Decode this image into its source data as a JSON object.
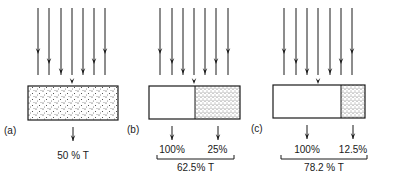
{
  "panels": [
    {
      "id": "a",
      "label": "(a)",
      "box": {
        "x": 28,
        "y": 86,
        "w": 90,
        "h": 34,
        "clear_fraction": 0.0
      },
      "incident_arrows_x": [
        38,
        49,
        61,
        72,
        83,
        94,
        105
      ],
      "outputs": [
        {
          "x": 73,
          "value": "50 % T"
        }
      ],
      "result": ""
    },
    {
      "id": "b",
      "label": "(b)",
      "box": {
        "x": 149,
        "y": 86,
        "w": 91,
        "h": 33,
        "clear_fraction": 0.5
      },
      "incident_arrows_x": [
        160,
        172,
        183,
        194,
        205,
        216,
        228
      ],
      "outputs": [
        {
          "x": 173,
          "value": "100%"
        },
        {
          "x": 213,
          "value": "25%"
        }
      ],
      "result": "62.5% T"
    },
    {
      "id": "c",
      "label": "(c)",
      "box": {
        "x": 273,
        "y": 85,
        "w": 92,
        "h": 33,
        "clear_fraction": 0.74
      },
      "incident_arrows_x": [
        284,
        296,
        307,
        318,
        330,
        341,
        352
      ],
      "outputs": [
        {
          "x": 309,
          "value": "100%"
        },
        {
          "x": 355,
          "value": "12.5%"
        }
      ],
      "result": "78.2 % T"
    }
  ],
  "colors": {
    "ink": "#1a1a1a",
    "background": "#ffffff"
  }
}
